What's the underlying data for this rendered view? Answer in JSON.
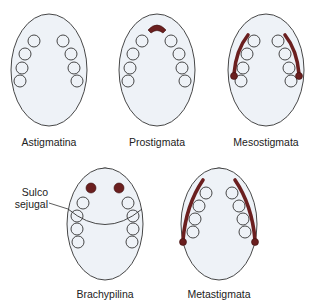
{
  "accent_color": "#6b1f1f",
  "body_fill": "#eef2f7",
  "panels": [
    {
      "id": "astigmatina",
      "label": "Astigmatina",
      "feature": "none"
    },
    {
      "id": "prostigmata",
      "label": "Prostigmata",
      "feature": "anterior-stigma"
    },
    {
      "id": "mesostigmata",
      "label": "Mesostigmata",
      "feature": "lateral-peritremes-short"
    },
    {
      "id": "brachypilina",
      "label": "Brachypilina",
      "feature": "dorsal-spots-and-sejugal-furrow"
    },
    {
      "id": "metastigmata",
      "label": "Metastigmata",
      "feature": "lateral-peritremes-long"
    }
  ],
  "annotation": {
    "line1": "Sulco",
    "line2": "sejugal"
  }
}
